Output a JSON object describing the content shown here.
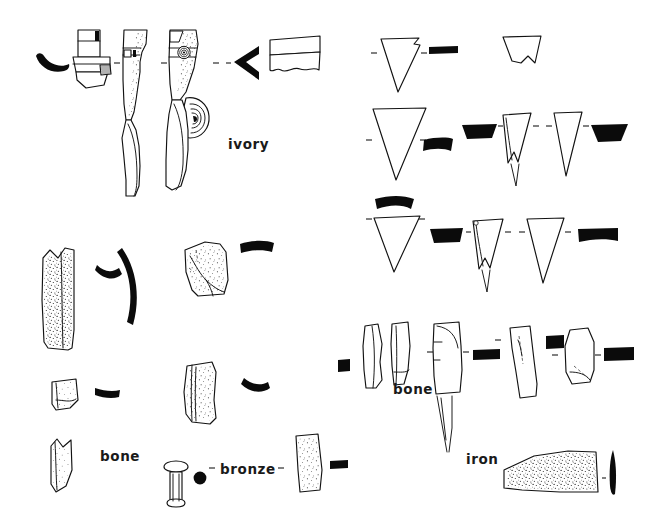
{
  "plate": {
    "title": "Archaeological small finds plate",
    "background_color": "#ffffff",
    "ink_color": "#121212",
    "width": 650,
    "height": 530
  },
  "labels": [
    {
      "id": "ivory",
      "text": "ivory",
      "x": 228,
      "y": 143
    },
    {
      "id": "bone-left",
      "text": "bone",
      "x": 100,
      "y": 455
    },
    {
      "id": "bronze",
      "text": "bronze",
      "x": 220,
      "y": 468
    },
    {
      "id": "bone-right",
      "text": "bone",
      "x": 393,
      "y": 388
    },
    {
      "id": "iron",
      "text": "iron",
      "x": 466,
      "y": 458
    }
  ],
  "groups": [
    {
      "id": "ivory-group",
      "material": "ivory",
      "label": "ivory",
      "region": "top-left",
      "object_count": 6,
      "objects": [
        {
          "id": "ivory-profile-crescent",
          "kind": "solid-profile",
          "shape": "crescent-comma"
        },
        {
          "id": "ivory-faceted-handle",
          "kind": "outline-elevation",
          "shape": "faceted-handle-with-boss"
        },
        {
          "id": "ivory-stippled-shaft",
          "kind": "outline-elevation",
          "shape": "curved-shaft-stippled"
        },
        {
          "id": "ivory-shaft-with-spiral",
          "kind": "outline-elevation",
          "shape": "curved-shaft-with-concentric-boss"
        },
        {
          "id": "ivory-profile-chevron",
          "kind": "solid-profile",
          "shape": "chevron"
        },
        {
          "id": "ivory-block",
          "kind": "outline-elevation",
          "shape": "rectangular-block-wavy-base"
        }
      ]
    },
    {
      "id": "arrowhead-group",
      "material": "unlabelled",
      "label": "",
      "region": "right",
      "object_count": 10,
      "rows": [
        {
          "row": 1,
          "objects": [
            {
              "id": "arrowhead-1",
              "kind": "outline-triangle",
              "shape": "broad-triangle-notched"
            },
            {
              "id": "arrowhead-1-section",
              "kind": "solid-profile",
              "shape": "flat-bar"
            },
            {
              "id": "arrowhead-2",
              "kind": "outline-triangle",
              "shape": "truncated-fragment"
            }
          ]
        },
        {
          "row": 2,
          "objects": [
            {
              "id": "arrowhead-3",
              "kind": "outline-triangle",
              "shape": "broad-triangle"
            },
            {
              "id": "arrowhead-3-section",
              "kind": "solid-profile",
              "shape": "curved-bar"
            },
            {
              "id": "arrowhead-4-section",
              "kind": "solid-profile",
              "shape": "trapezoid-bar"
            },
            {
              "id": "arrowhead-4",
              "kind": "outline-triangle",
              "shape": "narrow-triangle-with-tang"
            },
            {
              "id": "arrowhead-5",
              "kind": "outline-triangle",
              "shape": "narrow-triangle"
            },
            {
              "id": "arrowhead-5-section",
              "kind": "solid-profile",
              "shape": "trapezoid-bar"
            }
          ]
        },
        {
          "row": 3,
          "objects": [
            {
              "id": "arrowhead-6-section",
              "kind": "solid-profile",
              "shape": "curved-bar"
            },
            {
              "id": "arrowhead-6",
              "kind": "outline-triangle",
              "shape": "broad-triangle"
            },
            {
              "id": "arrowhead-7-section",
              "kind": "solid-profile",
              "shape": "trapezoid-bar"
            },
            {
              "id": "arrowhead-7",
              "kind": "outline-triangle",
              "shape": "narrow-triangle-with-tang"
            },
            {
              "id": "arrowhead-8",
              "kind": "outline-triangle",
              "shape": "narrow-triangle"
            },
            {
              "id": "arrowhead-8-section",
              "kind": "solid-profile",
              "shape": "flat-bar"
            }
          ]
        }
      ]
    },
    {
      "id": "bone-left-group",
      "material": "bone",
      "label": "bone",
      "region": "lower-left",
      "object_count": 6,
      "objects": [
        {
          "id": "bone-long-strip",
          "kind": "outline-stippled",
          "shape": "long-notched-strip"
        },
        {
          "id": "bone-long-strip-section",
          "kind": "solid-profile",
          "shape": "small-crescent"
        },
        {
          "id": "bone-long-strip-profile",
          "kind": "solid-profile",
          "shape": "long-curved-arc"
        },
        {
          "id": "bone-plaque",
          "kind": "outline-stippled",
          "shape": "trapezoid-plaque-cracked"
        },
        {
          "id": "bone-plaque-section",
          "kind": "solid-profile",
          "shape": "curved-bar"
        },
        {
          "id": "bone-small-fragment",
          "kind": "outline-stippled",
          "shape": "small-quadrilateral"
        },
        {
          "id": "bone-small-fragment-section",
          "kind": "solid-profile",
          "shape": "small-curved-bar"
        },
        {
          "id": "bone-wide-strip",
          "kind": "outline-stippled",
          "shape": "wide-curved-strip"
        },
        {
          "id": "bone-wide-strip-section",
          "kind": "solid-profile",
          "shape": "curved-bar"
        },
        {
          "id": "bone-pointed-fragment",
          "kind": "outline-stippled",
          "shape": "notched-pointed-fragment"
        }
      ]
    },
    {
      "id": "bronze-group",
      "material": "bronze",
      "label": "bronze",
      "region": "bottom-centre",
      "object_count": 3,
      "objects": [
        {
          "id": "bronze-rivet",
          "kind": "outline-elevation",
          "shape": "mushroom-head-rivet"
        },
        {
          "id": "bronze-rivet-plan",
          "kind": "solid-profile",
          "shape": "filled-circle"
        },
        {
          "id": "bronze-tapered-strip",
          "kind": "outline-stippled",
          "shape": "tapered-strip"
        },
        {
          "id": "bronze-tapered-strip-section",
          "kind": "solid-profile",
          "shape": "flat-bar"
        }
      ]
    },
    {
      "id": "bone-right-group",
      "material": "bone",
      "label": "bone",
      "region": "lower-right",
      "object_count": 6,
      "objects": [
        {
          "id": "bone-tool-1-section",
          "kind": "solid-profile",
          "shape": "small-block"
        },
        {
          "id": "bone-tool-1",
          "kind": "outline-elevation",
          "shape": "curved-sliver"
        },
        {
          "id": "bone-tool-2",
          "kind": "outline-elevation",
          "shape": "narrow-sliver"
        },
        {
          "id": "bone-tool-3",
          "kind": "outline-elevation",
          "shape": "broad-point-with-tang"
        },
        {
          "id": "bone-tool-3-section",
          "kind": "solid-profile",
          "shape": "flat-bar"
        },
        {
          "id": "bone-tool-4",
          "kind": "outline-elevation",
          "shape": "long-tapering-point"
        },
        {
          "id": "bone-tool-4-section",
          "kind": "solid-profile",
          "shape": "small-block"
        },
        {
          "id": "bone-tool-5",
          "kind": "outline-elevation",
          "shape": "rounded-plaque"
        },
        {
          "id": "bone-tool-5-section",
          "kind": "solid-profile",
          "shape": "flat-bar"
        }
      ]
    },
    {
      "id": "iron-group",
      "material": "iron",
      "label": "iron",
      "region": "bottom-right",
      "object_count": 1,
      "objects": [
        {
          "id": "iron-blade",
          "kind": "outline-stippled",
          "shape": "tapered-trapezoid-blade"
        },
        {
          "id": "iron-blade-section",
          "kind": "solid-profile",
          "shape": "tapered-spike"
        }
      ]
    }
  ]
}
